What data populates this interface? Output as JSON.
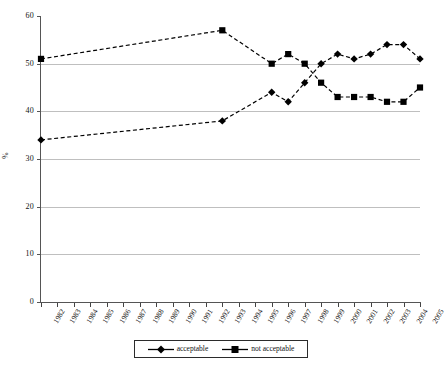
{
  "chart_data": {
    "type": "line",
    "title": "",
    "subtitle": "",
    "xlabel": "",
    "ylabel": "%",
    "ylim": [
      0,
      60
    ],
    "ytick_step": 10,
    "ytick_labels": [
      "0",
      "10",
      "20",
      "30",
      "40",
      "50",
      "60"
    ],
    "grid": true,
    "grid_axis": "y",
    "legend_position": "bottom-center",
    "categories": [
      "1982",
      "1983",
      "1984",
      "1985",
      "1986",
      "1987",
      "1988",
      "1989",
      "1990",
      "1991",
      "1992",
      "1993",
      "1994",
      "1995",
      "1996",
      "1997",
      "1998",
      "1999",
      "2000",
      "2001",
      "2002",
      "2003",
      "2004",
      "2005"
    ],
    "series": [
      {
        "name": "acceptable",
        "marker": "diamond",
        "line_style": "dashed",
        "color": "#000000",
        "values": [
          34,
          null,
          null,
          null,
          null,
          null,
          null,
          null,
          null,
          null,
          null,
          38,
          null,
          null,
          44,
          42,
          46,
          50,
          52,
          51,
          52,
          54,
          54,
          51
        ]
      },
      {
        "name": "not acceptable",
        "marker": "square",
        "line_style": "dashed",
        "color": "#000000",
        "values": [
          51,
          null,
          null,
          null,
          null,
          null,
          null,
          null,
          null,
          null,
          null,
          57,
          null,
          null,
          50,
          52,
          50,
          46,
          43,
          43,
          43,
          42,
          42,
          45
        ]
      }
    ],
    "annotations": []
  },
  "legend": {
    "items": [
      {
        "label": "acceptable",
        "marker": "diamond"
      },
      {
        "label": "not acceptable",
        "marker": "square"
      }
    ]
  }
}
